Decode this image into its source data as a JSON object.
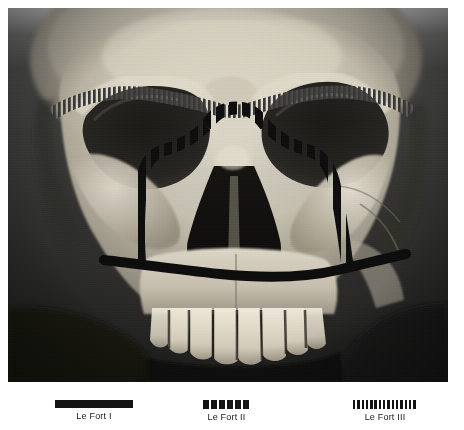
{
  "figure": {
    "photo": {
      "alt": "Frontal photograph of a human skull with the three Le Fort fracture lines marked",
      "subject": "human skull, frontal view",
      "background_color": "#1b1b1a",
      "bone_color": "#d8d4c8"
    }
  },
  "legend": {
    "items": [
      {
        "label": "Le Fort I",
        "pattern": "solid",
        "pattern_name": "solid-bar-swatch",
        "color": "#141414",
        "swatch_left": 55,
        "swatch_width": 78,
        "center_x": 94
      },
      {
        "label": "Le Fort II",
        "pattern": "dashed",
        "pattern_name": "coarse-dash-swatch",
        "color": "#141414",
        "dash_count": 6,
        "swatch_left": 203,
        "swatch_width": 47,
        "center_x": 227
      },
      {
        "label": "Le Fort III",
        "pattern": "hatched",
        "pattern_name": "fine-hatch-swatch",
        "color": "#141414",
        "hatch_count": 15,
        "swatch_left": 353,
        "swatch_width": 64,
        "center_x": 385
      }
    ]
  },
  "fracture_lines": {
    "le_fort_i": {
      "name": "Le Fort I",
      "description": "Horizontal solid line across the maxilla above the tooth roots",
      "style": "solid"
    },
    "le_fort_ii": {
      "name": "Le Fort II",
      "description": "Pyramidal dashed line from the nasal bridge down through the infraorbital rims to the maxilla",
      "style": "dashed"
    },
    "le_fort_iii": {
      "name": "Le Fort III",
      "description": "Craniofacial disjunction: fine hatched line across the orbits, nasal bridge and zygomatic arches",
      "style": "hatched"
    }
  }
}
